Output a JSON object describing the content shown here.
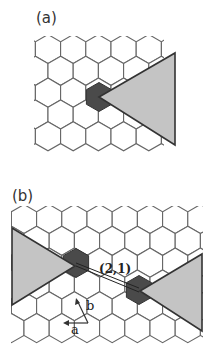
{
  "panels": [
    {
      "id": "a",
      "label": "(a)"
    },
    {
      "id": "b",
      "label": "(b)",
      "vector_label": "(2,1)",
      "basis": {
        "a": "a",
        "b": "b"
      }
    }
  ],
  "colors": {
    "hex_stroke": "#666666",
    "defect_fill": "#4a4a4a",
    "wedge_fill": "#c4c4c4",
    "wedge_stroke": "#333333"
  }
}
